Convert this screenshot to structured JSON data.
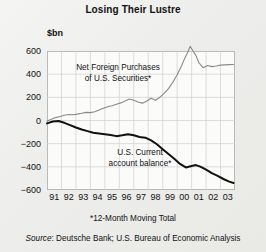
{
  "title": "Losing Their Lustre",
  "unit_label": "$bn",
  "footnote": "*12-Month Moving Total",
  "source_prefix": "Source",
  "source_text": ": Deutsche Bank; U.S. Bureau of Economic  Analysis",
  "annotations": {
    "series1_line1": "Net Foreign Purchases",
    "series1_line2": "of U.S. Securities*",
    "series2_line1": "U.S. Current",
    "series2_line2": "account balance*"
  },
  "colors": {
    "background": "#ededeb",
    "plot_background": "#fbfbfa",
    "grid": "#cfcfcc",
    "axis": "#b9b9b6",
    "series1": "#8a8a88",
    "series2": "#111111",
    "text": "#111111"
  },
  "chart_data": {
    "type": "line",
    "title": "Losing Their Lustre",
    "xlabel": "",
    "ylabel": "$bn",
    "ylim": [
      -600,
      600
    ],
    "yticks": [
      600,
      400,
      200,
      0,
      -200,
      -400,
      -600
    ],
    "ytick_labels": [
      "600",
      "400",
      "200",
      "0",
      "−200",
      "−400",
      "−600"
    ],
    "xlim": [
      1991,
      2004
    ],
    "xticks": [
      1991,
      1992,
      1993,
      1994,
      1995,
      1996,
      1997,
      1998,
      1999,
      2000,
      2001,
      2002,
      2003
    ],
    "xtick_labels": [
      "91",
      "92",
      "93",
      "94",
      "95",
      "96",
      "97",
      "98",
      "99",
      "00",
      "01",
      "02",
      "03"
    ],
    "grid": true,
    "legend": "annotations-inline",
    "series": [
      {
        "name": "Net Foreign Purchases of U.S. Securities*",
        "color": "#8a8a88",
        "width": 1.1,
        "x": [
          1991.0,
          1991.3,
          1991.6,
          1991.9,
          1992.2,
          1992.5,
          1992.8,
          1993.1,
          1993.4,
          1993.7,
          1994.0,
          1994.3,
          1994.6,
          1994.9,
          1995.2,
          1995.5,
          1995.8,
          1996.1,
          1996.4,
          1996.7,
          1997.0,
          1997.3,
          1997.6,
          1997.9,
          1998.2,
          1998.5,
          1998.8,
          1999.1,
          1999.4,
          1999.7,
          2000.0,
          2000.3,
          2000.5,
          2000.7,
          2000.9,
          2001.1,
          2001.3,
          2001.5,
          2001.8,
          2002.1,
          2002.4,
          2002.7,
          2003.0,
          2003.3,
          2003.6,
          2003.9
        ],
        "y": [
          -5,
          10,
          25,
          35,
          45,
          52,
          50,
          55,
          62,
          70,
          68,
          75,
          90,
          105,
          118,
          128,
          140,
          152,
          168,
          185,
          175,
          160,
          150,
          168,
          192,
          175,
          200,
          235,
          275,
          330,
          395,
          470,
          530,
          580,
          640,
          600,
          560,
          500,
          455,
          475,
          465,
          470,
          478,
          480,
          482,
          484
        ]
      },
      {
        "name": "U.S. Current account balance*",
        "color": "#111111",
        "width": 2.0,
        "x": [
          1991.0,
          1991.4,
          1991.8,
          1992.2,
          1992.6,
          1993.0,
          1993.4,
          1993.8,
          1994.2,
          1994.6,
          1995.0,
          1995.4,
          1995.8,
          1996.2,
          1996.6,
          1997.0,
          1997.4,
          1997.8,
          1998.2,
          1998.6,
          1999.0,
          1999.4,
          1999.8,
          2000.2,
          2000.6,
          2001.0,
          2001.3,
          2001.6,
          2002.0,
          2002.4,
          2002.8,
          2003.2,
          2003.6,
          2003.9
        ],
        "y": [
          -25,
          -8,
          -5,
          -20,
          -40,
          -60,
          -78,
          -92,
          -105,
          -112,
          -118,
          -125,
          -135,
          -128,
          -118,
          -128,
          -142,
          -148,
          -172,
          -205,
          -248,
          -290,
          -330,
          -375,
          -405,
          -392,
          -385,
          -398,
          -425,
          -455,
          -478,
          -505,
          -528,
          -540
        ]
      }
    ]
  }
}
